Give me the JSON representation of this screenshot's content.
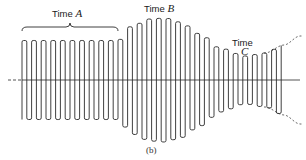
{
  "figure": {
    "caption": "(b)",
    "labels": {
      "time_a": {
        "word": "Time",
        "letter": "A"
      },
      "time_b": {
        "word": "Time",
        "letter": "B"
      },
      "time_c": {
        "word": "Time",
        "letter": "C"
      }
    },
    "colors": {
      "stroke": "#2a2a2a",
      "background": "#ffffff"
    },
    "axis": {
      "y": 80,
      "x_start": 8,
      "x_end": 300,
      "dashed_left_to": 22,
      "dashed_right_from": 290
    },
    "waveform": {
      "x_start": 22,
      "x_end": 284,
      "cycle_width": 9.6,
      "envelope_points": [
        {
          "x": 22,
          "half_amp": 39.5
        },
        {
          "x": 118,
          "half_amp": 39.5
        },
        {
          "x": 132,
          "half_amp": 54
        },
        {
          "x": 150,
          "half_amp": 61
        },
        {
          "x": 165,
          "half_amp": 62
        },
        {
          "x": 180,
          "half_amp": 58
        },
        {
          "x": 200,
          "half_amp": 46
        },
        {
          "x": 220,
          "half_amp": 32
        },
        {
          "x": 245,
          "half_amp": 24
        },
        {
          "x": 265,
          "half_amp": 27
        },
        {
          "x": 284,
          "half_amp": 35
        },
        {
          "x": 300,
          "half_amp": 44
        }
      ]
    },
    "brace_a": {
      "x_start": 22,
      "x_end": 118,
      "y": 27
    }
  }
}
